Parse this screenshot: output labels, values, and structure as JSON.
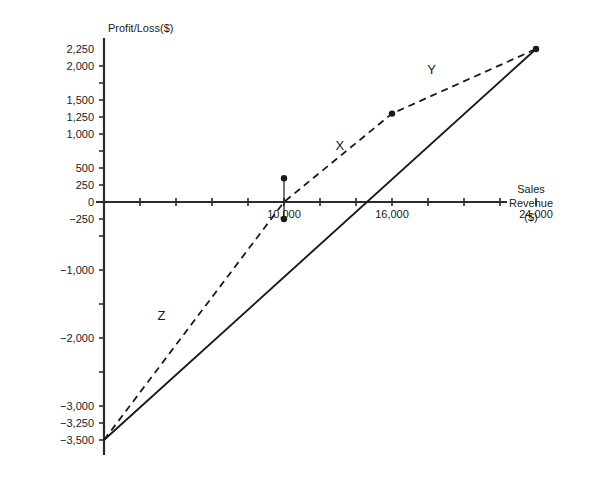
{
  "chart_data": {
    "type": "line",
    "title": "",
    "xlabel": "Sales Revenue ($)",
    "ylabel": "Profit/Loss($)",
    "grid": false,
    "legend": "none",
    "xlim": [
      0,
      26500
    ],
    "ylim": [
      -3650,
      2400
    ],
    "x_ticks_labeled": [
      {
        "value": 10000,
        "label": "10,000"
      },
      {
        "value": 16000,
        "label": "16,000"
      },
      {
        "value": 24000,
        "label": "24,000"
      }
    ],
    "x_ticks_all": [
      2000,
      4000,
      6000,
      8000,
      10000,
      12000,
      14000,
      16000,
      18000,
      20000,
      22000,
      24000
    ],
    "y_ticks_labeled": [
      {
        "value": 2250,
        "label": "2,250"
      },
      {
        "value": 2000,
        "label": "2,000"
      },
      {
        "value": 1500,
        "label": "1,500"
      },
      {
        "value": 1250,
        "label": "1,250"
      },
      {
        "value": 1000,
        "label": "1,000"
      },
      {
        "value": 500,
        "label": "500"
      },
      {
        "value": 250,
        "label": "250"
      },
      {
        "value": 0,
        "label": "0"
      },
      {
        "value": -250,
        "label": "−250"
      },
      {
        "value": -1000,
        "label": "−1,000"
      },
      {
        "value": -2000,
        "label": "−2,000"
      },
      {
        "value": -3000,
        "label": "−3,000"
      },
      {
        "value": -3250,
        "label": "−3,250"
      },
      {
        "value": -3500,
        "label": "−3,500"
      }
    ],
    "y_ticks_all": [
      2000,
      1750,
      1500,
      1250,
      1000,
      750,
      500,
      250,
      0,
      -250,
      -500,
      -1000,
      -1500,
      -2000,
      -2500,
      -3000,
      -3250,
      -3500
    ],
    "series": [
      {
        "name": "solid-line",
        "style": "solid",
        "points": [
          [
            0,
            -3500
          ],
          [
            24000,
            2250
          ]
        ]
      },
      {
        "name": "dashed-line",
        "style": "dashed",
        "points": [
          [
            0,
            -3500
          ],
          [
            10000,
            0
          ],
          [
            16000,
            1300
          ],
          [
            24000,
            2250
          ]
        ]
      },
      {
        "name": "vertical-segment-at-10000",
        "style": "solid-thin",
        "points": [
          [
            10000,
            350
          ],
          [
            10000,
            -250
          ]
        ]
      }
    ],
    "markers": [
      {
        "x": 10000,
        "y": 350
      },
      {
        "x": 10000,
        "y": -250
      },
      {
        "x": 16000,
        "y": 1300
      },
      {
        "x": 24000,
        "y": 2250
      }
    ],
    "annotations": [
      {
        "text": "X",
        "x": 13100,
        "y": 760
      },
      {
        "text": "Y",
        "x": 18200,
        "y": 1880
      },
      {
        "text": "Z",
        "x": 3200,
        "y": -1740
      }
    ],
    "colors": {
      "axis": "#2b2b2b",
      "line": "#1a1a1a",
      "text": "#1a1a1a",
      "background": "#ffffff"
    }
  },
  "axis_titles": {
    "y_title": "Profit/Loss($)",
    "x_title_line1": "Sales",
    "x_title_line2": "Revenue",
    "x_title_line3": "($)"
  },
  "tick_labels": {
    "y": [
      "2,250",
      "2,000",
      "1,500",
      "1,250",
      "1,000",
      "500",
      "250",
      "0",
      "−250",
      "−1,000",
      "−2,000",
      "−3,000",
      "−3,250",
      "−3,500"
    ],
    "x": [
      "10,000",
      "16,000",
      "24,000"
    ]
  },
  "curve_labels": {
    "x": "X",
    "y": "Y",
    "z": "Z"
  }
}
